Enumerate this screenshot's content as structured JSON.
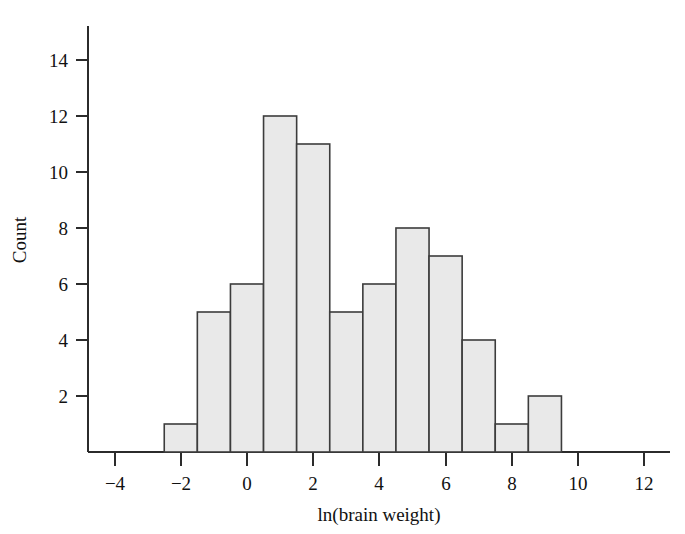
{
  "figure": {
    "clipped_title_fragment": "",
    "background_color": "#ffffff"
  },
  "axes": {
    "y": {
      "title": "Count",
      "tick_labels": [
        "2",
        "4",
        "6",
        "8",
        "10",
        "12",
        "14"
      ],
      "tick_values": [
        2,
        4,
        6,
        8,
        10,
        12,
        14
      ],
      "range": [
        0,
        15
      ]
    },
    "x": {
      "title": "ln(brain weight)",
      "tick_labels": [
        "−4",
        "−2",
        "0",
        "2",
        "4",
        "6",
        "8",
        "10",
        "12"
      ],
      "tick_values": [
        -4,
        -2,
        0,
        2,
        4,
        6,
        8,
        10,
        12
      ],
      "range": [
        -5.5,
        13.0
      ]
    }
  },
  "style": {
    "bar_fill": "#e9e9e9",
    "bar_stroke": "#3c3c3c",
    "axis_color": "#2b2b2b"
  },
  "chart_data": {
    "type": "bar",
    "title": "",
    "xlabel": "ln(brain weight)",
    "ylabel": "Count",
    "xlim": [
      -5.5,
      13.0
    ],
    "ylim": [
      0,
      15
    ],
    "grid": false,
    "legend": false,
    "bin_width": 1,
    "bin_edges": [
      -2.5,
      -1.5,
      -0.5,
      0.5,
      1.5,
      2.5,
      3.5,
      4.5,
      5.5,
      6.5,
      7.5,
      8.5,
      9.5
    ],
    "categories": [
      "-2.5 to -1.5",
      "-1.5 to -0.5",
      "-0.5 to 0.5",
      "0.5 to 1.5",
      "1.5 to 2.5",
      "2.5 to 3.5",
      "3.5 to 4.5",
      "4.5 to 5.5",
      "5.5 to 6.5",
      "6.5 to 7.5",
      "7.5 to 8.5",
      "8.5 to 9.5"
    ],
    "values": [
      1,
      5,
      6,
      12,
      11,
      5,
      6,
      8,
      7,
      4,
      1,
      2
    ],
    "total_count": 68
  }
}
